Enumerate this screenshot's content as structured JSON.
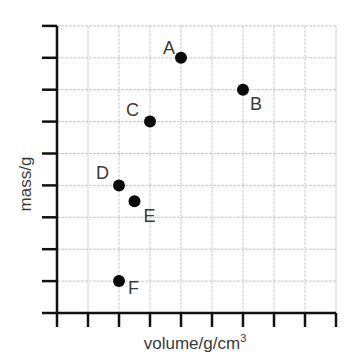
{
  "chart_data": {
    "type": "scatter",
    "title": "",
    "xlabel": "volume/g/cm",
    "xlabel_superscript": "3",
    "ylabel": "mass/g",
    "xlim": [
      0,
      9
    ],
    "ylim": [
      0,
      9
    ],
    "x_ticks": [
      0,
      1,
      2,
      3,
      4,
      5,
      6,
      7,
      8,
      9
    ],
    "y_ticks": [
      0,
      1,
      2,
      3,
      4,
      5,
      6,
      7,
      8,
      9
    ],
    "tick_labels_shown": false,
    "grid": true,
    "legend": "none",
    "points": [
      {
        "label": "A",
        "x": 4,
        "y": 8
      },
      {
        "label": "B",
        "x": 6,
        "y": 7
      },
      {
        "label": "C",
        "x": 3,
        "y": 6
      },
      {
        "label": "D",
        "x": 2,
        "y": 4
      },
      {
        "label": "E",
        "x": 2.5,
        "y": 3.5
      },
      {
        "label": "F",
        "x": 2,
        "y": 1
      }
    ],
    "colors": {
      "axis": "#111111",
      "grid": "#c8c8c8",
      "point": "#0a0a0a",
      "text": "#3a3a3a"
    }
  }
}
